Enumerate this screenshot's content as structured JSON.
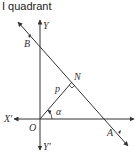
{
  "title": "I quadrant",
  "labels": {
    "y_pos": "Y",
    "y_neg": "Y'",
    "x_neg": "X'",
    "origin": "O",
    "b": "B",
    "a": "A",
    "n": "N",
    "p": "p",
    "alpha": "α"
  },
  "colors": {
    "line": "#333333",
    "text": "#333333"
  }
}
